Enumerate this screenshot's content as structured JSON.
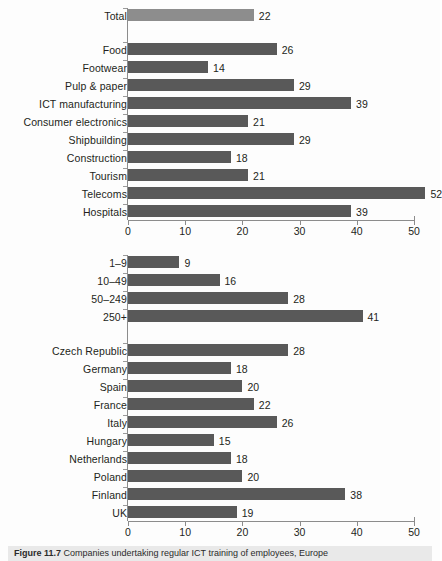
{
  "figure": {
    "caption_number": "Figure 11.7",
    "caption_text": "Companies undertaking regular ICT training of employees, Europe"
  },
  "colors": {
    "bar_dark": "#595959",
    "bar_light": "#8d8d8d",
    "axis": "#8c8c8c",
    "text": "#231f20",
    "background": "#ffffff",
    "caption_band": "#e9e9e9"
  },
  "chart_data": [
    {
      "type": "bar",
      "orientation": "horizontal",
      "id": "sectors",
      "title": "",
      "xlabel": "",
      "ylabel": "",
      "xlim": [
        0,
        50
      ],
      "xticks": [
        0,
        10,
        20,
        30,
        40,
        50
      ],
      "xticklabels": [
        "0",
        "10",
        "20",
        "30",
        "40",
        "50"
      ],
      "grid": false,
      "legend": false,
      "categories": [
        "Total",
        "Food",
        "Footwear",
        "Pulp & paper",
        "ICT manufacturing",
        "Consumer electronics",
        "Shipbuilding",
        "Construction",
        "Tourism",
        "Telecoms",
        "Hospitals"
      ],
      "values": [
        22,
        26,
        14,
        29,
        39,
        21,
        29,
        18,
        21,
        52,
        39
      ],
      "highlight_index": 0,
      "gap_after_index": 0
    },
    {
      "type": "bar",
      "orientation": "horizontal",
      "id": "size-and-country",
      "title": "",
      "xlabel": "",
      "ylabel": "",
      "xlim": [
        0,
        50
      ],
      "xticks": [
        0,
        10,
        20,
        30,
        40,
        50
      ],
      "xticklabels": [
        "0",
        "10",
        "20",
        "30",
        "40",
        "50"
      ],
      "grid": false,
      "legend": false,
      "categories": [
        "1–9",
        "10–49",
        "50–249",
        "250+",
        "Czech Republic",
        "Germany",
        "Spain",
        "France",
        "Italy",
        "Hungary",
        "Netherlands",
        "Poland",
        "Finland",
        "UK"
      ],
      "values": [
        9,
        16,
        28,
        41,
        28,
        18,
        20,
        22,
        26,
        15,
        18,
        20,
        38,
        19
      ],
      "highlight_index": -1,
      "gap_after_index": 3
    }
  ]
}
